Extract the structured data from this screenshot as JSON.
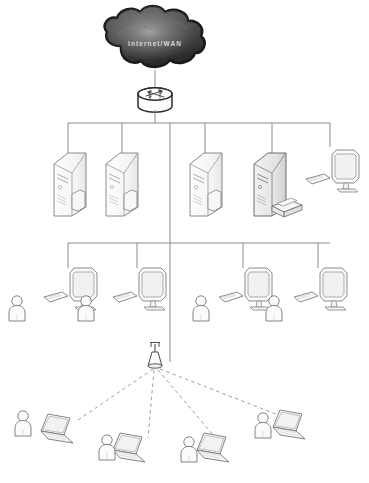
{
  "diagram": {
    "type": "network-topology",
    "background_color": "#ffffff",
    "line_color": "#8a8a8a",
    "dashed_link_color": "#9a9a9a",
    "device_outline_color": "#6e6e6e",
    "device_fill_color": "#fbfbfb",
    "cloud": {
      "label": "Internet/WAN",
      "fill_color": "#4a4a4a",
      "highlight_color": "#8e8e8e",
      "outline_color": "#1c1c1c",
      "text_color": "#d8d8d8"
    },
    "router": {
      "name": "Router",
      "icon": "router-icon",
      "shape": "cylinder-with-crossed-arrows"
    },
    "access_point": {
      "name": "Wireless Access Point",
      "icon": "wireless-access-point-icon",
      "link_style": "dashed"
    },
    "buses": [
      {
        "name": "server-bus",
        "y": 123,
        "x1": 68,
        "x2": 330,
        "drop_count": 5
      },
      {
        "name": "workstation-bus",
        "y": 243,
        "x1": 68,
        "x2": 330,
        "drop_count": 4
      }
    ],
    "tiers": [
      {
        "name": "server-tier",
        "label": "Servers and shared peripherals",
        "nodes": [
          {
            "id": "server-1",
            "type": "tower-server",
            "icon": "server-icon",
            "label": "Server",
            "x": 76,
            "shaded": false
          },
          {
            "id": "server-2",
            "type": "tower-server",
            "icon": "server-icon",
            "label": "Server",
            "x": 124,
            "shaded": false
          },
          {
            "id": "server-3",
            "type": "tower-server",
            "icon": "server-icon",
            "label": "Server",
            "x": 205,
            "shaded": false
          },
          {
            "id": "server-4",
            "type": "tower-server-with-printer",
            "icon": "server-printer-icon",
            "label": "Server with printer",
            "x": 272,
            "shaded": true
          },
          {
            "id": "admin-workstation",
            "type": "desktop-computer",
            "icon": "desktop-icon",
            "label": "Desktop",
            "x": 332,
            "shaded": false
          }
        ]
      },
      {
        "name": "workstation-tier",
        "label": "Wired user workstations",
        "nodes": [
          {
            "id": "workstation-1",
            "type": "desktop-with-user",
            "icon": "desktop-icon",
            "label": "Workstation",
            "x": 68
          },
          {
            "id": "workstation-2",
            "type": "desktop-with-user",
            "icon": "desktop-icon",
            "label": "Workstation",
            "x": 137
          },
          {
            "id": "workstation-3",
            "type": "desktop-with-user",
            "icon": "desktop-icon",
            "label": "Workstation",
            "x": 243
          },
          {
            "id": "workstation-4",
            "type": "desktop-with-user",
            "icon": "desktop-icon",
            "label": "Workstation",
            "x": 318
          }
        ]
      },
      {
        "name": "wireless-tier",
        "label": "Wireless laptop clients",
        "nodes": [
          {
            "id": "laptop-1",
            "type": "laptop-with-user",
            "icon": "laptop-icon",
            "label": "Laptop",
            "x": 60,
            "y": 424
          },
          {
            "id": "laptop-2",
            "type": "laptop-with-user",
            "icon": "laptop-icon",
            "label": "Laptop",
            "x": 128,
            "y": 447
          },
          {
            "id": "laptop-3",
            "type": "laptop-with-user",
            "icon": "laptop-icon",
            "label": "Laptop",
            "x": 212,
            "y": 447
          },
          {
            "id": "laptop-4",
            "type": "laptop-with-user",
            "icon": "laptop-icon",
            "label": "Laptop",
            "x": 286,
            "y": 424
          }
        ]
      }
    ],
    "counts": {
      "servers": 4,
      "desktops": 5,
      "laptops": 4,
      "users": 8,
      "routers": 1,
      "access_points": 1,
      "printers": 1
    }
  }
}
